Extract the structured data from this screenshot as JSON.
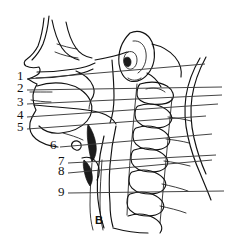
{
  "figure": {
    "letter": "B",
    "background_color": "#ffffff",
    "ink_color": "#111111",
    "leader_color": "#3a3a3a",
    "width": 236,
    "height": 241
  },
  "labels": [
    {
      "id": "1",
      "text": "1",
      "x": 17,
      "y": 77,
      "line_x1": 27,
      "line_y1": 79,
      "line_x2": 205,
      "line_y2": 64
    },
    {
      "id": "2",
      "text": "2",
      "x": 17,
      "y": 89,
      "line_x1": 27,
      "line_y1": 90,
      "line_x2": 222,
      "line_y2": 87
    },
    {
      "id": "3",
      "text": "3",
      "x": 17,
      "y": 103,
      "line_x1": 27,
      "line_y1": 104,
      "line_x2": 222,
      "line_y2": 95
    },
    {
      "id": "4",
      "text": "4",
      "x": 17,
      "y": 116,
      "line_x1": 27,
      "line_y1": 117,
      "line_x2": 218,
      "line_y2": 104
    },
    {
      "id": "5",
      "text": "5",
      "x": 17,
      "y": 128,
      "line_x1": 27,
      "line_y1": 129,
      "line_x2": 206,
      "line_y2": 116
    },
    {
      "id": "6",
      "text": "6",
      "x": 50,
      "y": 146,
      "line_x1": 60,
      "line_y1": 147,
      "line_x2": 212,
      "line_y2": 134
    },
    {
      "id": "7",
      "text": "7",
      "x": 58,
      "y": 162,
      "line_x1": 68,
      "line_y1": 163,
      "line_x2": 216,
      "line_y2": 155
    },
    {
      "id": "8",
      "text": "8",
      "x": 58,
      "y": 172,
      "line_x1": 68,
      "line_y1": 173,
      "line_x2": 212,
      "line_y2": 160
    },
    {
      "id": "9",
      "text": "9",
      "x": 58,
      "y": 193,
      "line_x1": 68,
      "line_y1": 193,
      "line_x2": 224,
      "line_y2": 191
    }
  ]
}
